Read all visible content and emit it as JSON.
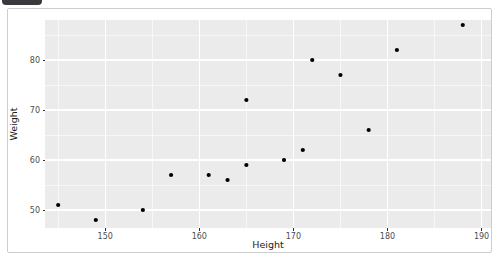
{
  "window": {
    "tab_fragment": "partially-visible-dark-browser-tab"
  },
  "chart_data": {
    "type": "scatter",
    "title": "",
    "xlabel": "Height",
    "ylabel": "Weight",
    "x_ticks": [
      150,
      160,
      170,
      180,
      190
    ],
    "y_ticks": [
      50,
      60,
      70,
      80
    ],
    "x_minor_gridlines": [
      145,
      155,
      165,
      175,
      185
    ],
    "y_minor_gridlines": [
      55,
      65,
      75,
      85
    ],
    "xlim": [
      143.6,
      191.0
    ],
    "ylim": [
      46.4,
      88.0
    ],
    "grid": true,
    "legend": "none",
    "points": [
      {
        "height": 145,
        "weight": 51
      },
      {
        "height": 149,
        "weight": 48
      },
      {
        "height": 154,
        "weight": 50
      },
      {
        "height": 157,
        "weight": 57
      },
      {
        "height": 161,
        "weight": 57
      },
      {
        "height": 163,
        "weight": 56
      },
      {
        "height": 165,
        "weight": 59
      },
      {
        "height": 165,
        "weight": 72
      },
      {
        "height": 169,
        "weight": 60
      },
      {
        "height": 171,
        "weight": 62
      },
      {
        "height": 172,
        "weight": 80
      },
      {
        "height": 175,
        "weight": 77
      },
      {
        "height": 178,
        "weight": 66
      },
      {
        "height": 181,
        "weight": 82
      },
      {
        "height": 188,
        "weight": 87
      }
    ],
    "colors": {
      "panel_background": "#EBEBEB",
      "gridline": "#FFFFFF",
      "point": "#000000",
      "tick_mark": "#333333",
      "tick_text": "#4D4D4D",
      "axis_title_text": "#1A1A1A",
      "figure_border": "#CDCDCD",
      "tab_fragment": "#3A3A3E"
    }
  }
}
